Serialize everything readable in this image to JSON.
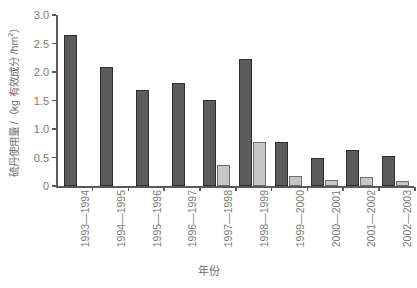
{
  "chart_data": {
    "type": "bar",
    "title": "",
    "xlabel": "年份",
    "ylabel": "硫丹使用量 /（kg 有效成分 /hm²）",
    "ylabel_parts": {
      "main": "硫丹使用量 /（kg 有效成分 /hm",
      "sup": "2",
      "tail": "）"
    },
    "categories": [
      "1993—1994",
      "1994—1995",
      "1995—1996",
      "1996—1997",
      "1997—1998",
      "1998—1999",
      "1999—2000",
      "2000—2001",
      "2001—2002",
      "2002—2003"
    ],
    "series": [
      {
        "name": "series-dark",
        "color": "#5b5b5b",
        "values": [
          2.65,
          2.08,
          1.68,
          1.81,
          1.51,
          2.23,
          0.78,
          0.5,
          0.64,
          0.53
        ]
      },
      {
        "name": "series-light",
        "color": "#c6c6c6",
        "values": [
          null,
          null,
          null,
          null,
          0.36,
          0.78,
          0.18,
          0.11,
          0.16,
          0.09
        ]
      }
    ],
    "ylim": [
      0,
      3.0
    ],
    "yticks": [
      0,
      0.5,
      1.0,
      1.5,
      2.0,
      2.5,
      3.0
    ],
    "ytick_labels": [
      "0",
      "0.5",
      "1.0",
      "1.5",
      "2.0",
      "2.5",
      "3.0"
    ],
    "grid": false,
    "legend": "none"
  }
}
